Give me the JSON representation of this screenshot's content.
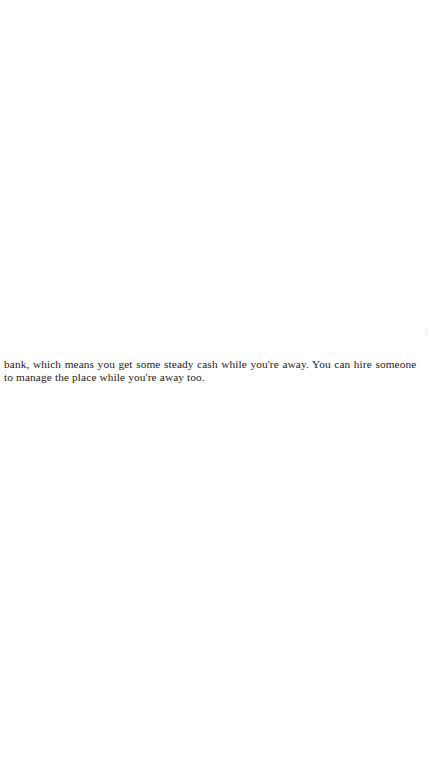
{
  "page": {
    "background_color": "#ffffff",
    "text_color": "#1b1b1b",
    "width": 435,
    "height": 769
  },
  "body_text": {
    "paragraph_continuation": true,
    "full_text": "bank, which means you get some steady cash while you're away. You can hire someone to manage the place while you're away too.",
    "lines": [
      "bank, which means you get some steady cash while you're away. You can hire someone",
      "to manage the place while you're away too."
    ]
  }
}
